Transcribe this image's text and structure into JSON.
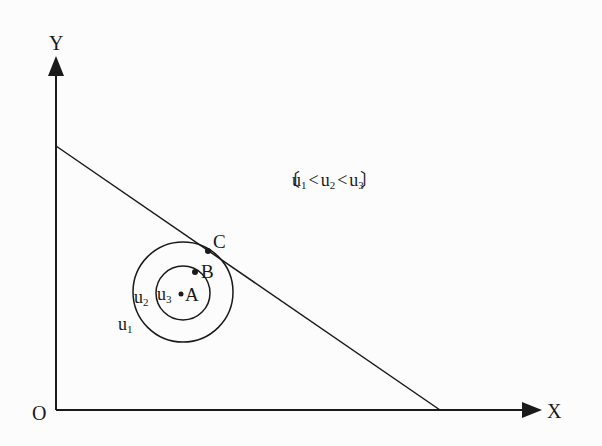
{
  "diagram": {
    "axes": {
      "y_label": "Y",
      "x_label": "X",
      "origin_label": "O"
    },
    "annotation": {
      "open": "〔",
      "u1": "u",
      "u1_sub": "1",
      "lt1": "<",
      "u2": "u",
      "u2_sub": "2",
      "lt2": "<",
      "u3": "u",
      "u3_sub": "3",
      "close": "〕"
    },
    "curves": {
      "outer": {
        "label": "u",
        "sub": "2"
      },
      "inner": {
        "label": "u",
        "sub": "3"
      },
      "outside": {
        "label": "u",
        "sub": "1"
      }
    },
    "points": {
      "A": "A",
      "B": "B",
      "C": "C"
    },
    "colors": {
      "line": "#1a1a1a",
      "background": "#fcfcfc"
    }
  }
}
